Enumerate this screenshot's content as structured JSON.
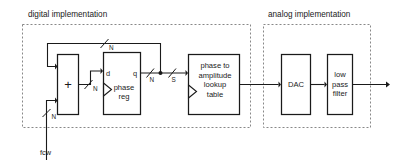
{
  "figure": {
    "kind": "block-diagram",
    "title_groups": {
      "digital": "digital implementation",
      "analog": "analog implementation"
    },
    "blocks": {
      "adder": {
        "label": "+",
        "name": "adder-block"
      },
      "phase_reg": {
        "line1": "phase",
        "line2": "reg",
        "port_d": "d",
        "port_q": "q"
      },
      "lookup": {
        "line1": "phase to",
        "line2": "amplitude",
        "line3": "lookup",
        "line4": "table"
      },
      "dac": {
        "label": "DAC"
      },
      "lpf": {
        "line1": "low",
        "line2": "pass",
        "line3": "filter"
      }
    },
    "signals": {
      "input_label": "fcw",
      "bus_input": "N",
      "bus_adder_out": "N",
      "bus_feedback": "N",
      "bus_q_out": "N",
      "bus_s": "S"
    }
  }
}
